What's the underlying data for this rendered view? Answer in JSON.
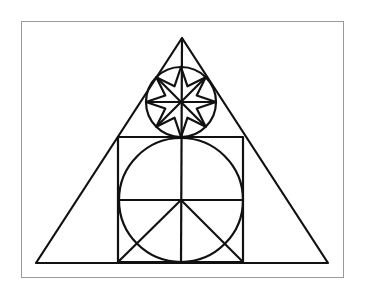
{
  "diagram": {
    "stroke_color": "#111111",
    "frame_color": "#9a9a9a",
    "background": "#ffffff",
    "triangle": {
      "apex": [
        182,
        38
      ],
      "left": [
        36,
        263
      ],
      "right": [
        328,
        263
      ]
    },
    "square": {
      "x": 118,
      "y": 137,
      "size": 125
    },
    "big_circle": {
      "cx": 181,
      "cy": 200,
      "r": 62
    },
    "small_circle": {
      "cx": 181,
      "cy": 102,
      "r": 35,
      "star_points": 8,
      "star_inner_r": 17
    }
  }
}
